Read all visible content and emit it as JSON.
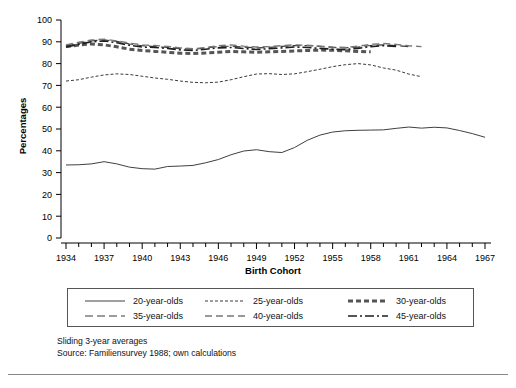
{
  "chart_data": {
    "type": "line",
    "title": "",
    "xlabel": "Birth Cohort",
    "ylabel": "Percentages",
    "xlim": [
      1934,
      1967
    ],
    "ylim": [
      0,
      100
    ],
    "ytick_step": 10,
    "yticks": [
      0,
      10,
      20,
      30,
      40,
      50,
      60,
      70,
      80,
      90,
      100
    ],
    "xticks_labeled": [
      1934,
      1937,
      1940,
      1943,
      1946,
      1949,
      1952,
      1955,
      1958,
      1961,
      1964,
      1967
    ],
    "xtick_minor_step": 1,
    "grid": false,
    "legend_position": "below-axes",
    "notes": [
      "Sliding 3-year averages",
      "Source: Familiensurvey 1988; own calculations"
    ],
    "series": [
      {
        "name": "20-year-olds",
        "style": "solid",
        "color": "#404040",
        "width": 1.0,
        "x": [
          1934,
          1935,
          1936,
          1937,
          1938,
          1939,
          1940,
          1941,
          1942,
          1943,
          1944,
          1945,
          1946,
          1947,
          1948,
          1949,
          1950,
          1951,
          1952,
          1953,
          1954,
          1955,
          1956,
          1957,
          1958,
          1959,
          1960,
          1961,
          1962,
          1963,
          1964,
          1965,
          1966,
          1967
        ],
        "y": [
          33.5,
          33.6,
          34.0,
          35.0,
          34.0,
          32.5,
          31.8,
          31.6,
          32.8,
          33.0,
          33.3,
          34.5,
          36.0,
          38.2,
          39.9,
          40.5,
          39.6,
          39.2,
          41.5,
          44.8,
          47.2,
          48.6,
          49.2,
          49.4,
          49.5,
          49.6,
          50.3,
          50.9,
          50.4,
          50.8,
          50.5,
          49.3,
          47.9,
          46.2
        ]
      },
      {
        "name": "25-year-olds",
        "style": "dotted-fine",
        "color": "#3a3a3a",
        "width": 1.0,
        "x": [
          1934,
          1935,
          1936,
          1937,
          1938,
          1939,
          1940,
          1941,
          1942,
          1943,
          1944,
          1945,
          1946,
          1947,
          1948,
          1949,
          1950,
          1951,
          1952,
          1953,
          1954,
          1955,
          1956,
          1957,
          1958,
          1959,
          1960,
          1961,
          1962
        ],
        "y": [
          72.0,
          72.6,
          73.8,
          74.8,
          75.3,
          75.0,
          74.2,
          73.4,
          72.8,
          72.0,
          71.4,
          71.2,
          71.5,
          72.6,
          74.0,
          75.2,
          75.4,
          75.0,
          75.3,
          76.3,
          77.4,
          78.6,
          79.5,
          80.0,
          79.4,
          78.0,
          77.0,
          75.2,
          74.0
        ]
      },
      {
        "name": "30-year-olds",
        "style": "thick-dashed",
        "color": "#555555",
        "width": 3.0,
        "x": [
          1934,
          1935,
          1936,
          1937,
          1938,
          1939,
          1940,
          1941,
          1942,
          1943,
          1944,
          1945,
          1946,
          1947,
          1948,
          1949,
          1950,
          1951,
          1952,
          1953,
          1954,
          1955,
          1956,
          1957,
          1958
        ],
        "y": [
          87.8,
          88.5,
          89.0,
          88.6,
          87.7,
          86.6,
          86.0,
          85.6,
          85.2,
          84.8,
          84.6,
          84.9,
          85.2,
          85.6,
          85.4,
          85.2,
          85.4,
          85.6,
          85.8,
          86.0,
          86.2,
          86.1,
          85.9,
          85.6,
          85.4
        ]
      },
      {
        "name": "35-year-olds",
        "style": "long-dash",
        "color": "#3a3a3a",
        "width": 1.2,
        "x": [
          1934,
          1935,
          1936,
          1937,
          1938,
          1939,
          1940,
          1941,
          1942,
          1943,
          1944,
          1945,
          1946,
          1947,
          1948,
          1949,
          1950,
          1951,
          1952,
          1953,
          1954,
          1955,
          1956,
          1957,
          1958,
          1959,
          1960,
          1961
        ],
        "y": [
          88.0,
          89.3,
          90.4,
          90.9,
          90.2,
          89.0,
          88.2,
          87.8,
          87.4,
          86.9,
          86.6,
          87.2,
          87.8,
          88.0,
          87.6,
          87.2,
          87.4,
          87.9,
          88.3,
          88.2,
          87.9,
          87.4,
          87.2,
          87.6,
          88.3,
          88.6,
          88.3,
          87.8
        ]
      },
      {
        "name": "40-year-olds",
        "style": "med-dash",
        "color": "#777777",
        "width": 1.4,
        "x": [
          1934,
          1935,
          1936,
          1937,
          1938,
          1939,
          1940,
          1941,
          1942,
          1943,
          1944,
          1945,
          1946,
          1947,
          1948,
          1949,
          1950,
          1951,
          1952,
          1953,
          1954,
          1955,
          1956,
          1957,
          1958,
          1959,
          1960,
          1961,
          1962
        ],
        "y": [
          88.6,
          89.8,
          90.8,
          91.2,
          90.4,
          89.4,
          88.6,
          88.3,
          87.9,
          87.2,
          86.8,
          87.4,
          88.2,
          88.6,
          88.0,
          87.6,
          87.8,
          88.2,
          88.6,
          88.4,
          88.0,
          87.6,
          87.4,
          88.0,
          88.8,
          89.2,
          88.8,
          88.2,
          87.8
        ]
      },
      {
        "name": "45-year-olds",
        "style": "dash-dot",
        "color": "#1e1e1e",
        "width": 1.6,
        "x": [
          1934,
          1935,
          1936,
          1937,
          1938,
          1939,
          1940,
          1941,
          1942,
          1943,
          1944,
          1945,
          1946,
          1947,
          1948,
          1949,
          1950,
          1951,
          1952,
          1953,
          1954,
          1955,
          1956,
          1957,
          1958,
          1959,
          1960
        ],
        "y": [
          87.6,
          88.8,
          90.0,
          90.4,
          89.6,
          88.4,
          87.6,
          87.4,
          87.0,
          86.3,
          86.0,
          86.6,
          87.2,
          87.4,
          86.9,
          86.5,
          86.8,
          87.2,
          87.6,
          87.4,
          87.0,
          86.6,
          86.4,
          87.0,
          87.8,
          88.2,
          87.9
        ]
      }
    ]
  },
  "legend": {
    "items": [
      {
        "label": "20-year-olds",
        "style": "solid"
      },
      {
        "label": "25-year-olds",
        "style": "dotted-fine"
      },
      {
        "label": "30-year-olds",
        "style": "thick-dashed"
      },
      {
        "label": "35-year-olds",
        "style": "long-dash"
      },
      {
        "label": "40-year-olds",
        "style": "med-dash"
      },
      {
        "label": "45-year-olds",
        "style": "dash-dot"
      }
    ]
  }
}
